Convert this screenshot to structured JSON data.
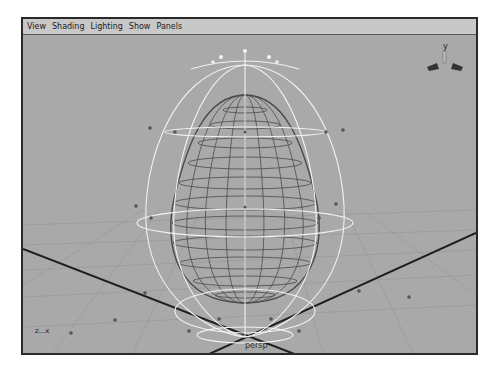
{
  "viewport": {
    "menu": [
      {
        "label": "View"
      },
      {
        "label": "Shading"
      },
      {
        "label": "Lighting"
      },
      {
        "label": "Show"
      },
      {
        "label": "Panels"
      }
    ],
    "camera_label": "persp",
    "axis_indicator": "z...x",
    "view_cube_up_axis": "y",
    "object": "egg-shaped polygon wireframe with lattice deformer",
    "colors": {
      "background": "#a9a9a9",
      "menubar": "#c8c8c8",
      "wireframe": "#4a4a4a",
      "lattice": "#f2f2f2",
      "grid_axis": "#1e1e1e"
    }
  }
}
